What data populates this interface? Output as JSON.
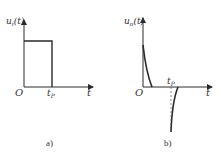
{
  "figure_a": {
    "y_label": "u",
    "y_label_sub": "i",
    "y_label_suffix": "(t)",
    "origin_label": "O",
    "tp_label": "t",
    "tp_sub": "P",
    "x_label": "t",
    "caption": "a)"
  },
  "figure_b": {
    "y_label": "u",
    "y_label_sub": "o",
    "y_label_suffix": "(t)",
    "origin_label": "O",
    "tp_label": "t",
    "tp_sub": "P",
    "x_label": "t",
    "caption": "b)"
  },
  "colors": {
    "line": "#2a2a2a",
    "text": "#333333"
  }
}
